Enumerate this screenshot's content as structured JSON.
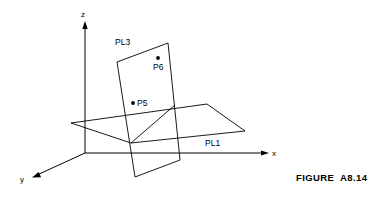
{
  "figure": {
    "caption": "FIGURE  A8.14",
    "caption_x": 296,
    "caption_y": 172
  },
  "axes": {
    "origin": {
      "x": 85,
      "y": 153
    },
    "z": {
      "label": "z",
      "label_x": 81,
      "label_y": 17,
      "tip_x": 85,
      "tip_y": 22
    },
    "x": {
      "label": "x",
      "label_x": 272,
      "label_y": 156,
      "tip_x": 268,
      "tip_y": 153
    },
    "y": {
      "label": "y",
      "label_x": 20,
      "label_y": 182,
      "tip_x": 33,
      "tip_y": 177
    }
  },
  "planes": {
    "pl1": {
      "label": "PL1",
      "label_x": 205,
      "label_y": 146,
      "outline": "71,123 131,143 245,131 207,104",
      "note": "horizontal quadrilateral plane"
    },
    "pl3": {
      "label": "PL3",
      "label_x": 115,
      "label_y": 45,
      "outline": "117,62 168,43 180,160 135,177",
      "note": "tilted vertical quadrilateral plane"
    },
    "intersection": {
      "from_x": 131,
      "from_y": 143,
      "to_x": 175,
      "to_y": 105
    }
  },
  "points": [
    {
      "id": "P5",
      "label": "P5",
      "dot_x": 133,
      "dot_y": 103,
      "label_x": 137,
      "label_y": 106
    },
    {
      "id": "P6",
      "label": "P6",
      "dot_x": 158,
      "dot_y": 58,
      "label_x": 153,
      "label_y": 70
    }
  ],
  "colors": {
    "stroke": "#000000",
    "background": "#ffffff"
  }
}
